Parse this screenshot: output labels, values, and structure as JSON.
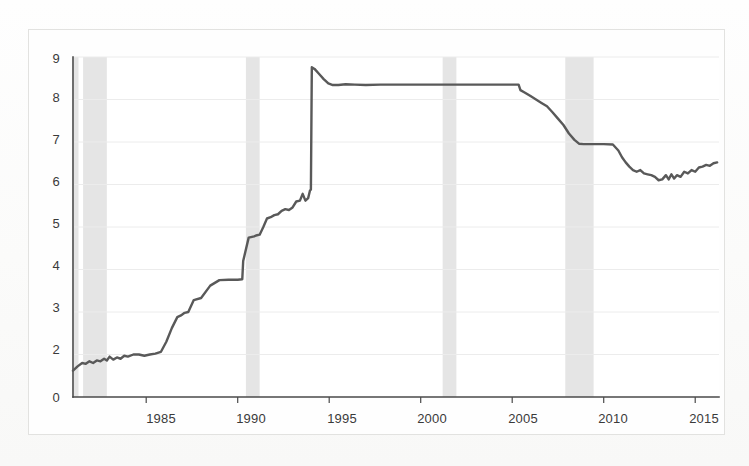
{
  "figure": {
    "title": "",
    "background_color": "#fdfdfc",
    "frame_color": "#e2e2e0",
    "line_color": "#595959",
    "grid_color": "#ececec",
    "axis_color": "#4a4a4a",
    "recession_band_color": "#e4e4e4"
  },
  "chart_data": {
    "type": "line",
    "title": "",
    "xlabel": "",
    "ylabel": "",
    "xlim": [
      1981.0,
      2016.3
    ],
    "ylim": [
      1.0,
      9.0
    ],
    "grid": true,
    "legend": null,
    "y_tick_labels": [
      "9",
      "8",
      "7",
      "6",
      "5",
      "4",
      "3",
      "2",
      "0"
    ],
    "y_tick_values": [
      9,
      8,
      7,
      6,
      5,
      4,
      3,
      2,
      1
    ],
    "y_axis_note": "baseline tick is labeled 0 although it sits at the position of 1 (broken axis)",
    "x_tick_labels": [
      "1985",
      "1990",
      "1995",
      "2000",
      "2005",
      "2010",
      "2015"
    ],
    "x_tick_values": [
      1985,
      1990,
      1995,
      2000,
      2005,
      2010,
      2015
    ],
    "shaded_regions": [
      {
        "label": "recession",
        "x0": 1981.55,
        "x1": 1982.85
      },
      {
        "label": "recession",
        "x0": 1990.45,
        "x1": 1991.2
      },
      {
        "label": "recession",
        "x0": 2001.2,
        "x1": 2001.95
      },
      {
        "label": "recession",
        "x0": 2007.9,
        "x1": 2009.45
      },
      {
        "label": "recession",
        "x0": 1981.05,
        "x1": 1981.3
      }
    ],
    "series": [
      {
        "name": "series-1",
        "color": "#595959",
        "x": [
          1981.0,
          1981.25,
          1981.5,
          1981.7,
          1981.9,
          1982.1,
          1982.3,
          1982.5,
          1982.7,
          1982.85,
          1983.0,
          1983.2,
          1983.4,
          1983.6,
          1983.8,
          1984.0,
          1984.3,
          1984.6,
          1984.9,
          1985.2,
          1985.5,
          1985.8,
          1986.1,
          1986.4,
          1986.7,
          1986.9,
          1987.1,
          1987.3,
          1987.6,
          1988.0,
          1988.5,
          1989.0,
          1989.5,
          1990.0,
          1990.25,
          1990.3,
          1990.6,
          1990.9,
          1991.0,
          1991.2,
          1991.4,
          1991.6,
          1991.8,
          1992.0,
          1992.2,
          1992.4,
          1992.6,
          1992.8,
          1993.0,
          1993.2,
          1993.4,
          1993.55,
          1993.7,
          1993.85,
          1993.95,
          1994.0,
          1994.05,
          1994.2,
          1994.45,
          1994.7,
          1994.95,
          1995.2,
          1995.5,
          1995.9,
          1996.4,
          1997.0,
          1997.8,
          1998.6,
          1999.4,
          2000.2,
          2001.0,
          2001.8,
          2002.6,
          2003.4,
          2004.2,
          2005.0,
          2005.35,
          2005.45,
          2005.7,
          2006.0,
          2006.3,
          2006.6,
          2006.9,
          2007.2,
          2007.5,
          2007.8,
          2008.1,
          2008.4,
          2008.65,
          2008.9,
          2009.1,
          2009.3,
          2009.5,
          2010.0,
          2010.5,
          2010.8,
          2011.0,
          2011.2,
          2011.4,
          2011.6,
          2011.8,
          2012.0,
          2012.2,
          2012.4,
          2012.6,
          2012.8,
          2013.0,
          2013.2,
          2013.4,
          2013.55,
          2013.7,
          2013.85,
          2014.0,
          2014.2,
          2014.4,
          2014.6,
          2014.8,
          2015.0,
          2015.2,
          2015.4,
          2015.6,
          2015.8,
          2016.0,
          2016.2
        ],
        "y": [
          1.62,
          1.72,
          1.8,
          1.78,
          1.84,
          1.8,
          1.86,
          1.84,
          1.9,
          1.86,
          1.95,
          1.88,
          1.93,
          1.9,
          1.97,
          1.95,
          2.0,
          2.0,
          1.97,
          2.0,
          2.02,
          2.06,
          2.3,
          2.62,
          2.88,
          2.92,
          2.98,
          3.0,
          3.28,
          3.33,
          3.62,
          3.75,
          3.76,
          3.76,
          3.77,
          4.2,
          4.75,
          4.78,
          4.8,
          4.82,
          5.0,
          5.2,
          5.23,
          5.28,
          5.3,
          5.38,
          5.42,
          5.4,
          5.46,
          5.6,
          5.62,
          5.78,
          5.62,
          5.68,
          5.86,
          5.88,
          8.76,
          8.72,
          8.6,
          8.48,
          8.38,
          8.34,
          8.34,
          8.36,
          8.35,
          8.34,
          8.35,
          8.35,
          8.35,
          8.35,
          8.35,
          8.35,
          8.35,
          8.35,
          8.35,
          8.35,
          8.35,
          8.22,
          8.16,
          8.08,
          8.0,
          7.92,
          7.84,
          7.7,
          7.55,
          7.4,
          7.2,
          7.05,
          6.96,
          6.95,
          6.95,
          6.95,
          6.95,
          6.95,
          6.94,
          6.8,
          6.64,
          6.52,
          6.42,
          6.34,
          6.3,
          6.34,
          6.26,
          6.24,
          6.22,
          6.18,
          6.1,
          6.12,
          6.22,
          6.12,
          6.24,
          6.14,
          6.22,
          6.18,
          6.3,
          6.26,
          6.34,
          6.3,
          6.4,
          6.42,
          6.46,
          6.44,
          6.5,
          6.52
        ]
      }
    ]
  }
}
